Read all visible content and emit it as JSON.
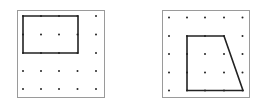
{
  "figures": [
    {
      "name": "rectangle-on-dot-grid",
      "frame": {
        "x": 17,
        "y": 10,
        "w": 87,
        "h": 87
      },
      "grid": {
        "cols": [
          23,
          41,
          59,
          77.5,
          96
        ],
        "rows": [
          16,
          34.5,
          53,
          71,
          89
        ]
      },
      "shape_points": [
        [
          23,
          16
        ],
        [
          78,
          16
        ],
        [
          78,
          53
        ],
        [
          23,
          53
        ]
      ]
    },
    {
      "name": "trapezoid-on-dot-grid",
      "frame": {
        "x": 162,
        "y": 10,
        "w": 87,
        "h": 87
      },
      "grid": {
        "cols": [
          169,
          187,
          205,
          224,
          242.5
        ],
        "rows": [
          17.5,
          36,
          54,
          72.5,
          90.5
        ]
      },
      "shape_points": [
        [
          187,
          36
        ],
        [
          224,
          36
        ],
        [
          243,
          90.5
        ],
        [
          187,
          90.5
        ]
      ]
    }
  ],
  "colors": {
    "frame": "#9a9a9a",
    "dot": "#222222",
    "shape": "#222222"
  }
}
